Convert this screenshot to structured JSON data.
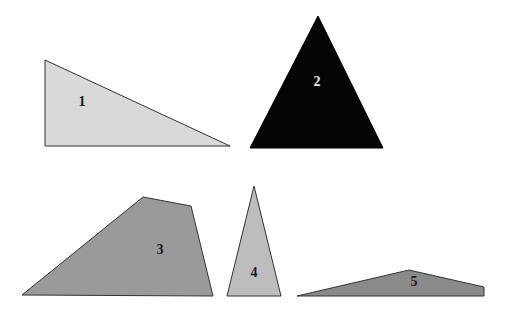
{
  "shapes": [
    {
      "id": "1",
      "label": "1",
      "type": "right-triangle",
      "fill": "#d9d9d9",
      "label_color": "#1a1a1a",
      "points": "45,60 230,146 45,146",
      "label_pos": [
        82,
        106
      ]
    },
    {
      "id": "2",
      "label": "2",
      "type": "triangle",
      "fill": "#050505",
      "label_color": "#e6e6e6",
      "points": "318,16 383,148 250,148",
      "label_pos": [
        317,
        86
      ]
    },
    {
      "id": "3",
      "label": "3",
      "type": "quadrilateral",
      "fill": "#9a9a9a",
      "label_color": "#1a1a1a",
      "points": "22,295 143,197 191,206 213,296",
      "label_pos": [
        160,
        254
      ]
    },
    {
      "id": "4",
      "label": "4",
      "type": "isosceles-triangle",
      "fill": "#bdbdbd",
      "label_color": "#1a1a1a",
      "points": "254,186 281,296 227,296",
      "label_pos": [
        254,
        277
      ]
    },
    {
      "id": "5",
      "label": "5",
      "type": "quadrilateral",
      "fill": "#8a8a8a",
      "label_color": "#1a1a1a",
      "points": "297,296 409,270 484,287 484,296",
      "label_pos": [
        414,
        286
      ]
    }
  ],
  "stroke_color": "#333333"
}
